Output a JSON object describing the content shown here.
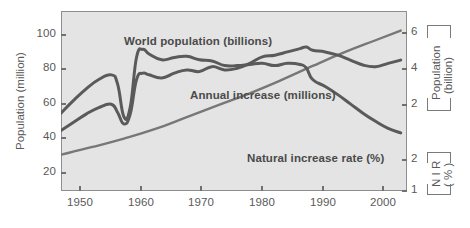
{
  "chart_data": {
    "type": "line",
    "title": "",
    "xlabel": "",
    "xlim": [
      1950,
      2005
    ],
    "grid": false,
    "legend_position": "inline-annotations",
    "axes": {
      "left": {
        "label": "Population (million)",
        "ticks": [
          20,
          40,
          60,
          80,
          100
        ],
        "tick_labels": [
          "20",
          "40",
          "60",
          "80",
          "100"
        ],
        "lim": [
          0,
          110
        ]
      },
      "right_upper": {
        "label_line1": "Population",
        "label_line2": "(billion)",
        "ticks": [
          2,
          4,
          6
        ],
        "tick_labels": [
          "2",
          "4",
          "6"
        ],
        "lim": [
          1.4,
          7.0
        ]
      },
      "right_lower": {
        "label_line1": "N I R",
        "label_line2": "( % )",
        "ticks": [
          1,
          2
        ],
        "tick_labels": [
          "1",
          "2"
        ],
        "lim": [
          0.8,
          2.35
        ]
      },
      "x": {
        "ticks": [
          1950,
          1960,
          1970,
          1980,
          1990,
          2000
        ],
        "tick_labels": [
          "1950",
          "1960",
          "1970",
          "1980",
          "1990",
          "2000"
        ]
      }
    },
    "series": [
      {
        "name": "World population (billions)",
        "label": "World population (billions)",
        "unit": "billions",
        "axis": "right_upper",
        "color": "#777777",
        "x": [
          1950,
          1955,
          1960,
          1965,
          1970,
          1975,
          1980,
          1985,
          1990,
          1995,
          2000,
          2004
        ],
        "values": [
          2.53,
          2.77,
          3.03,
          3.33,
          3.7,
          4.07,
          4.44,
          4.85,
          5.29,
          5.71,
          6.09,
          6.39
        ]
      },
      {
        "name": "Annual increase (millions)",
        "label": "Annual increase (millions)",
        "unit": "millions",
        "axis": "left",
        "color": "#5a5a5a",
        "x": [
          1950,
          1952,
          1954,
          1956,
          1958,
          1959,
          1960,
          1961,
          1962,
          1963,
          1964,
          1966,
          1968,
          1970,
          1972,
          1974,
          1976,
          1978,
          1980,
          1982,
          1984,
          1986,
          1988,
          1989,
          1990,
          1992,
          1994,
          1996,
          1998,
          2000,
          2002,
          2004
        ],
        "values": [
          37,
          42,
          47,
          51,
          53,
          48,
          41,
          47,
          68,
          72,
          71,
          69,
          72,
          74,
          73,
          76,
          74,
          75,
          78,
          82,
          83,
          85,
          87,
          88,
          86,
          85,
          83,
          80,
          77,
          76,
          78,
          80
        ]
      },
      {
        "name": "Natural increase rate (%)",
        "label": "Natural increase rate (%)",
        "unit": "%",
        "axis": "right_lower",
        "color": "#5a5a5a",
        "x": [
          1950,
          1952,
          1954,
          1956,
          1958,
          1959,
          1960,
          1961,
          1962,
          1963,
          1964,
          1966,
          1968,
          1970,
          1972,
          1974,
          1976,
          1978,
          1980,
          1982,
          1984,
          1986,
          1988,
          1989,
          1990,
          1992,
          1994,
          1996,
          1998,
          2000,
          2002,
          2004
        ],
        "values": [
          1.47,
          1.58,
          1.68,
          1.76,
          1.8,
          1.72,
          1.44,
          1.52,
          1.95,
          2.02,
          1.98,
          1.93,
          1.95,
          1.96,
          1.93,
          1.92,
          1.88,
          1.88,
          1.89,
          1.9,
          1.88,
          1.9,
          1.89,
          1.86,
          1.76,
          1.7,
          1.63,
          1.55,
          1.47,
          1.4,
          1.34,
          1.3
        ]
      }
    ]
  },
  "left_axis": {
    "title": "Population (million)",
    "t1": "100",
    "t2": "80",
    "t3": "60",
    "t4": "40",
    "t5": "20"
  },
  "right_axis_upper": {
    "title_line1": "Population",
    "title_line2": "(billion)",
    "t1": "6",
    "t2": "4",
    "t3": "2"
  },
  "right_axis_lower": {
    "title_line1": "N I R",
    "title_line2": "( % )",
    "t1": "2",
    "t2": "1"
  },
  "x_axis": {
    "t1": "1950",
    "t2": "1960",
    "t3": "1970",
    "t4": "1980",
    "t5": "1990",
    "t6": "2000"
  },
  "annotations": {
    "world_population": "World population (billions)",
    "annual_increase": "Annual increase (millions)",
    "natural_increase_rate": "Natural increase rate (%)"
  },
  "colors": {
    "plot_background": "#e4e4e4",
    "frame": "#8e8e8e",
    "world_population_line": "#777777",
    "annual_increase_line": "#5a5a5a",
    "natural_increase_line": "#5a5a5a",
    "text": "#5a5a5a"
  }
}
